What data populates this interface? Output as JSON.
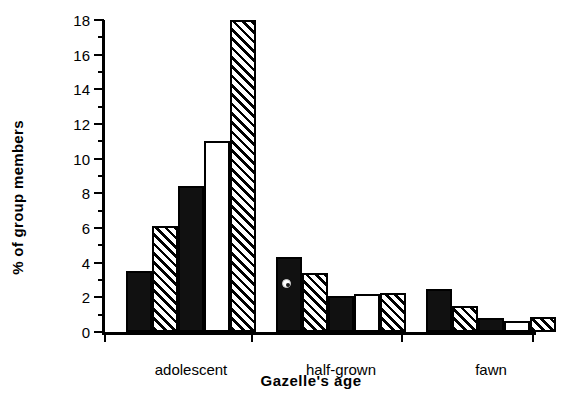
{
  "chart_data": {
    "type": "bar",
    "title": "",
    "xlabel": "Gazelle's age",
    "ylabel": "% of group members",
    "categories": [
      "adolescent",
      "half-grown",
      "fawn"
    ],
    "ylim": [
      0,
      18
    ],
    "ytick_major": [
      0,
      2,
      4,
      6,
      8,
      10,
      12,
      14,
      16,
      18
    ],
    "ytick_minor": [
      1,
      3,
      5,
      7,
      9,
      11,
      13,
      15,
      17
    ],
    "ytick_labels": [
      "0",
      "2",
      "4",
      "6",
      "8",
      "10",
      "12",
      "14",
      "16",
      "18"
    ],
    "grid": false,
    "legend": "none",
    "series": [
      {
        "name": "series-1",
        "fill": "solid",
        "values": [
          3.5,
          4.3,
          2.5
        ]
      },
      {
        "name": "series-2",
        "fill": "hatch",
        "values": [
          6.1,
          3.4,
          1.5
        ]
      },
      {
        "name": "series-3",
        "fill": "solid",
        "values": [
          8.4,
          2.1,
          0.8
        ]
      },
      {
        "name": "series-4",
        "fill": "open",
        "values": [
          11.0,
          2.2,
          0.65
        ]
      },
      {
        "name": "series-5",
        "fill": "hatch",
        "values": [
          18.0,
          2.25,
          0.85
        ]
      }
    ],
    "annotations": [
      {
        "name": "scan-artifact-dot",
        "note": "small ringed dot on half-grown series-1 bar"
      }
    ]
  }
}
